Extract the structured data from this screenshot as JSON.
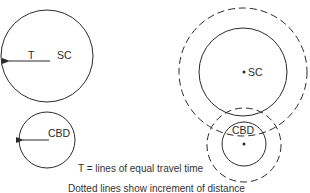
{
  "left_diagram": {
    "sc_circle": {
      "label": "SC",
      "arrow_label": "T"
    },
    "cbd_circle": {
      "label": "CBD"
    }
  },
  "right_diagram": {
    "sc_circle": {
      "label": "SC",
      "dashed_ring": true
    },
    "cbd_circle": {
      "label": "CBD",
      "dashed_ring": true
    }
  },
  "captions": {
    "line1": "T = lines of equal travel time",
    "line2": "Dotted lines show increment of distance"
  },
  "colors": {
    "stroke": "#2a2a2a",
    "background": "#ffffff"
  }
}
